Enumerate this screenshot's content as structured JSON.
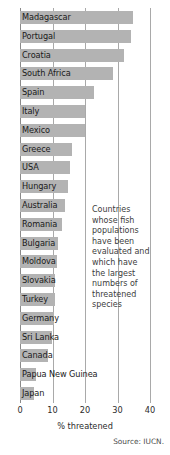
{
  "chart_data": {
    "type": "bar",
    "orientation": "horizontal",
    "title": "",
    "xlabel": "% threatened",
    "ylabel": "",
    "xlim": [
      0,
      40
    ],
    "xticks": [
      0,
      10,
      20,
      30,
      40
    ],
    "grid": true,
    "legend": null,
    "bar_color": "#b3b3b3",
    "categories": [
      "Madagascar",
      "Portugal",
      "Croatia",
      "South Africa",
      "Spain",
      "Italy",
      "Mexico",
      "Greece",
      "USA",
      "Hungary",
      "Australia",
      "Romania",
      "Bulgaria",
      "Moldova",
      "Slovakia",
      "Turkey",
      "Germany",
      "Sri Lanka",
      "Canada",
      "Papua New Guinea",
      "Japan"
    ],
    "values": [
      34.8,
      34.0,
      32.0,
      28.5,
      22.8,
      20.0,
      20.0,
      16.0,
      15.4,
      14.8,
      13.8,
      13.0,
      11.7,
      11.4,
      10.8,
      10.8,
      10.4,
      9.8,
      8.6,
      5.0,
      4.3
    ],
    "annotations": [
      {
        "text": "Countries whose fish populations have been evaluated and which have the largest numbers of threatened species"
      }
    ],
    "source": "Source: IUCN."
  }
}
